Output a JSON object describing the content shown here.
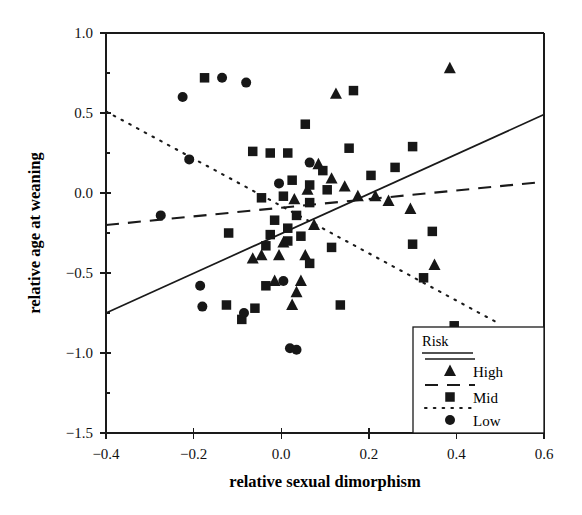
{
  "chart_data": {
    "type": "scatter",
    "title": "",
    "xlabel": "relative sexual dimorphism",
    "ylabel": "relative age at weaning",
    "xlim": [
      -0.4,
      0.6
    ],
    "ylim": [
      -1.5,
      1.0
    ],
    "xticks": [
      "-0.4",
      "-0.2",
      "0.0",
      "0.2",
      "0.4",
      "0.6"
    ],
    "xtick_values": [
      -0.4,
      -0.2,
      0.0,
      0.2,
      0.4,
      0.6
    ],
    "yticks": [
      "1.0",
      "0.5",
      "0.0",
      "-0.5",
      "-1.0",
      "-1.5"
    ],
    "ytick_values": [
      1.0,
      0.5,
      0.0,
      -0.5,
      -1.0,
      -1.5
    ],
    "grid": false,
    "legend_position": "bottom-right",
    "legend_title": "Risk",
    "series": [
      {
        "name": "High",
        "marker": "triangle",
        "linestyle": "solid",
        "color": "#171717",
        "points": [
          [
            0.085,
            0.18
          ],
          [
            0.115,
            0.09
          ],
          [
            0.145,
            0.04
          ],
          [
            0.06,
            0.02
          ],
          [
            0.175,
            -0.02
          ],
          [
            0.215,
            -0.02
          ],
          [
            0.03,
            -0.04
          ],
          [
            0.245,
            -0.05
          ],
          [
            0.125,
            0.62
          ],
          [
            0.295,
            -0.1
          ],
          [
            0.075,
            -0.2
          ],
          [
            0.35,
            -0.45
          ],
          [
            0.385,
            0.78
          ],
          [
            -0.005,
            -0.39
          ],
          [
            0.055,
            -0.39
          ],
          [
            -0.065,
            -0.41
          ],
          [
            -0.015,
            -0.55
          ],
          [
            0.045,
            -0.55
          ],
          [
            0.035,
            -0.62
          ],
          [
            0.025,
            -0.7
          ],
          [
            -0.045,
            -0.39
          ],
          [
            0.005,
            -0.31
          ]
        ]
      },
      {
        "name": "Mid",
        "marker": "square",
        "linestyle": "dashed",
        "color": "#171717",
        "points": [
          [
            -0.175,
            0.72
          ],
          [
            0.165,
            0.64
          ],
          [
            0.055,
            0.43
          ],
          [
            0.3,
            0.29
          ],
          [
            0.155,
            0.28
          ],
          [
            -0.065,
            0.26
          ],
          [
            -0.025,
            0.25
          ],
          [
            0.015,
            0.25
          ],
          [
            0.26,
            0.16
          ],
          [
            0.095,
            0.14
          ],
          [
            0.205,
            0.11
          ],
          [
            0.025,
            0.08
          ],
          [
            0.065,
            0.05
          ],
          [
            0.105,
            0.02
          ],
          [
            0.005,
            -0.02
          ],
          [
            -0.045,
            -0.03
          ],
          [
            0.065,
            -0.06
          ],
          [
            0.035,
            -0.14
          ],
          [
            -0.015,
            -0.17
          ],
          [
            0.015,
            -0.22
          ],
          [
            -0.12,
            -0.25
          ],
          [
            -0.025,
            -0.26
          ],
          [
            0.045,
            -0.27
          ],
          [
            0.015,
            -0.3
          ],
          [
            0.3,
            -0.32
          ],
          [
            -0.035,
            -0.33
          ],
          [
            0.115,
            -0.34
          ],
          [
            0.345,
            -0.24
          ],
          [
            0.065,
            -0.44
          ],
          [
            -0.125,
            -0.7
          ],
          [
            -0.09,
            -0.79
          ],
          [
            -0.06,
            -0.72
          ],
          [
            -0.035,
            -0.58
          ],
          [
            0.325,
            -0.53
          ],
          [
            0.395,
            -0.83
          ],
          [
            0.135,
            -0.7
          ]
        ]
      },
      {
        "name": "Low",
        "marker": "circle",
        "linestyle": "dotted",
        "color": "#171717",
        "points": [
          [
            -0.135,
            0.72
          ],
          [
            -0.08,
            0.69
          ],
          [
            -0.225,
            0.6
          ],
          [
            -0.21,
            0.21
          ],
          [
            -0.275,
            -0.14
          ],
          [
            0.065,
            0.19
          ],
          [
            -0.005,
            0.06
          ],
          [
            0.005,
            -0.55
          ],
          [
            0.02,
            -0.97
          ],
          [
            0.035,
            -0.98
          ],
          [
            -0.185,
            -0.58
          ],
          [
            -0.085,
            -0.75
          ],
          [
            -0.18,
            -0.71
          ]
        ]
      }
    ],
    "fit_lines": [
      {
        "name": "High",
        "style": "solid",
        "x0": -0.4,
        "y0": -0.75,
        "x1": 0.6,
        "y1": 0.49
      },
      {
        "name": "Mid",
        "style": "dashed",
        "x0": -0.4,
        "y0": -0.2,
        "x1": 0.6,
        "y1": 0.07
      },
      {
        "name": "Low",
        "style": "dotted",
        "x0": -0.4,
        "y0": 0.51,
        "x1": 0.5,
        "y1": -0.82
      }
    ]
  },
  "legend": {
    "title": "Risk",
    "entries": [
      {
        "label": "High",
        "marker": "triangle",
        "linestyle": "solid"
      },
      {
        "label": "Mid",
        "marker": "square",
        "linestyle": "dashed"
      },
      {
        "label": "Low",
        "marker": "circle",
        "linestyle": "dotted"
      }
    ]
  }
}
